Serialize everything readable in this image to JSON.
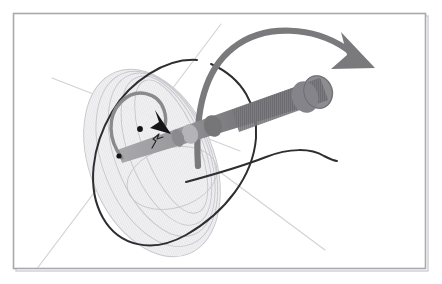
{
  "figure": {
    "width": 442,
    "height": 284,
    "background_color": "#ffffff",
    "frame": {
      "name": "image-border",
      "x": 13,
      "y": 13,
      "width": 413,
      "height": 256,
      "stroke_color": "#a9a9ad",
      "fill_color": "#ffffff"
    }
  },
  "colors": {
    "background": "#ffffff",
    "frame_stroke": "#a9a9ad",
    "frame_shadow": "#cfcfd4",
    "axis_line": "#d2d2d6",
    "cone_outline": "#c6c6cc",
    "cone_fill": "#f1f1f3",
    "cone_fill_inner": "#eaeaee",
    "nutation_curve": "#2e2e30",
    "precession_arrow": "#7a7a7d",
    "spin_loop": "#8a8a8d",
    "spin_arrowhead": "#151517",
    "rod_dark": "#6e6e72",
    "rod_mid": "#86868a",
    "rod_light": "#a8a8ac",
    "rod_cap": "#8f8f93",
    "pivot_dot": "#141416"
  },
  "elements": {
    "cone": {
      "name": "precession-cone",
      "description": "Tilted cone swept by the spin axis, drawn as nested ellipse outlines with translucent fill",
      "apex_x": 118,
      "apex_y": 155,
      "ellipse_center_x": 152,
      "ellipse_center_y": 163,
      "ellipse_rx": 62,
      "ellipse_ry": 98,
      "rotation_deg": -22,
      "nested_count": 4
    },
    "rod": {
      "name": "spinning-rod",
      "description": "Banded cylindrical rod (gyroscope axle) running from lower-left pivot to upper-right end cap",
      "tip_x": 118,
      "tip_y": 155,
      "end_x": 325,
      "end_y": 88,
      "half_width": 9,
      "band_count": 3,
      "end_cap_rx": 13,
      "end_cap_ry": 16
    },
    "precession_arrow": {
      "name": "precession-arrow",
      "description": "Large gray curved arrow sweeping over the top, indicating precession direction",
      "start_x": 120,
      "start_y": 168,
      "tip_x": 372,
      "tip_y": 66,
      "color": "#7a7a7d",
      "stroke_width": 6.2
    },
    "spin_arrow": {
      "name": "spin-arrow",
      "description": "Small looped arrow near the cone apex, indicating rotation/spin sense",
      "center_x": 133,
      "center_y": 120,
      "radius": 22,
      "tip_x": 164,
      "tip_y": 124,
      "loop_color": "#8a8a8d",
      "head_color": "#151517"
    },
    "nutation_curve": {
      "name": "nutation-curve",
      "description": "Dark curve tracing the nutation path of the axis tip around the cone and off to the right",
      "color": "#2e2e30",
      "stroke_width": 2.0,
      "right_end_x": 336,
      "right_end_y": 160
    },
    "axis_lines": [
      {
        "name": "axis-line-upper-left",
        "x1": 52,
        "y1": 78,
        "x2": 233,
        "y2": 148
      },
      {
        "name": "axis-line-lower-left",
        "x1": 36,
        "y1": 268,
        "x2": 218,
        "y2": 27
      },
      {
        "name": "axis-line-lower-right",
        "x1": 196,
        "y1": 158,
        "x2": 323,
        "y2": 248
      }
    ],
    "pivot_dot": {
      "name": "pivot-dot",
      "x": 119,
      "y": 156,
      "r": 2.6
    },
    "mark_dot": {
      "name": "reference-dot",
      "x": 140,
      "y": 129,
      "r": 2.9
    },
    "squiggle": {
      "name": "angle-squiggle",
      "description": "Small hand-drawn angle tick mark on the rod near the pivot",
      "x": 160,
      "y": 141
    }
  },
  "labels": {
    "caption": ""
  }
}
